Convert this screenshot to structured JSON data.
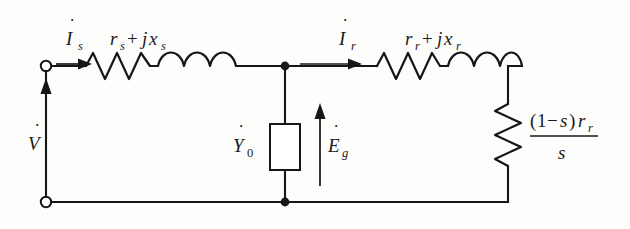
{
  "diagram": {
    "ink_color": "#161616",
    "background_color": "#fdfdfc",
    "labels": {
      "source_current": {
        "symbol": "I",
        "dot": "˙",
        "subscript": "s",
        "full": "İs"
      },
      "source_voltage": {
        "symbol": "V",
        "dot": "˙",
        "subscript": "",
        "full": "V̇"
      },
      "stator_impedance": {
        "text": "r",
        "sub1": "s",
        "op": "+",
        "j": "j",
        "x": "x",
        "sub2": "s",
        "full": "rs+jxs"
      },
      "rotor_current": {
        "symbol": "I",
        "dot": "˙",
        "subscript": "r",
        "full": "İr"
      },
      "rotor_impedance": {
        "text": "r",
        "sub1": "r",
        "op": "+",
        "j": "j",
        "x": "x",
        "sub2": "r",
        "full": "rr+jxr"
      },
      "shunt_admittance": {
        "symbol": "Y",
        "dot": "˙",
        "subscript": "0",
        "full": "Ẏ0"
      },
      "air_gap_emf": {
        "symbol": "E",
        "dot": "˙",
        "subscript": "g",
        "full": "Ėg"
      },
      "mechanical_load": {
        "numerator_open": "(",
        "numerator_one": "1",
        "numerator_minus": "−",
        "numerator_s": "s",
        "numerator_close": ")",
        "numerator_r": "r",
        "numerator_r_sub": "r",
        "denominator": "s",
        "full": "(1−s)rr / s"
      }
    },
    "components": [
      {
        "name": "stator-resistor",
        "type": "resistor",
        "orientation": "horizontal",
        "label": "rs"
      },
      {
        "name": "stator-inductor",
        "type": "inductor",
        "orientation": "horizontal",
        "label": "jxs"
      },
      {
        "name": "shunt-admittance-box",
        "type": "box",
        "orientation": "vertical",
        "label": "Ẏ0"
      },
      {
        "name": "rotor-resistor",
        "type": "resistor",
        "orientation": "horizontal",
        "label": "rr"
      },
      {
        "name": "rotor-inductor",
        "type": "inductor",
        "orientation": "horizontal",
        "label": "jxr"
      },
      {
        "name": "load-resistor",
        "type": "resistor",
        "orientation": "vertical",
        "label": "(1−s)rr/s"
      }
    ],
    "terminals": [
      {
        "name": "input-terminal-top",
        "x": 46,
        "y": 66
      },
      {
        "name": "input-terminal-bottom",
        "x": 46,
        "y": 202
      }
    ],
    "nodes": [
      {
        "name": "junction-top",
        "x": 285,
        "y": 66
      },
      {
        "name": "junction-bottom",
        "x": 285,
        "y": 202
      }
    ],
    "current_arrows": [
      {
        "name": "stator-current-arrow",
        "direction": "right"
      },
      {
        "name": "rotor-current-arrow",
        "direction": "right"
      },
      {
        "name": "voltage-arrow",
        "direction": "up"
      },
      {
        "name": "emf-arrow",
        "direction": "up"
      }
    ]
  }
}
